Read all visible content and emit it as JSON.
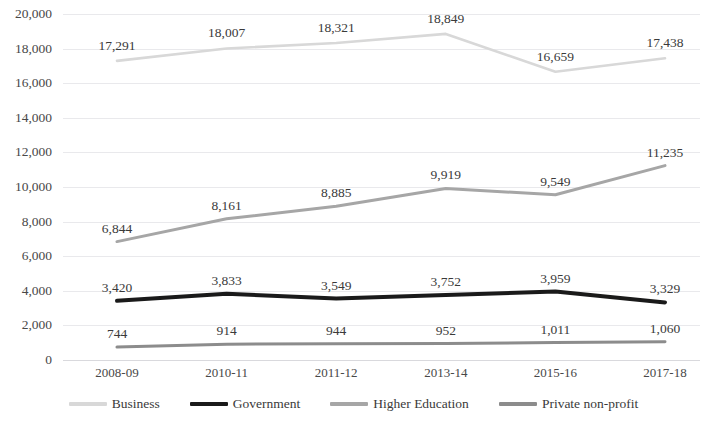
{
  "chart_data": {
    "type": "line",
    "title": "",
    "xlabel": "",
    "ylabel": "",
    "grid": true,
    "legend_position": "bottom",
    "ylim": [
      0,
      20000
    ],
    "ytick_step": 2000,
    "categories": [
      "2008-09",
      "2010-11",
      "2011-12",
      "2013-14",
      "2015-16",
      "2017-18"
    ],
    "yticks": [
      "0",
      "2,000",
      "4,000",
      "6,000",
      "8,000",
      "10,000",
      "12,000",
      "14,000",
      "16,000",
      "18,000",
      "20,000"
    ],
    "series": [
      {
        "name": "Business",
        "color": "#d8d8d8",
        "width": 2.6,
        "values": [
          17291,
          18007,
          18321,
          18849,
          16659,
          17438
        ],
        "labels": [
          "17,291",
          "18,007",
          "18,321",
          "18,849",
          "16,659",
          "17,438"
        ]
      },
      {
        "name": "Government",
        "color": "#1a1a1a",
        "width": 4.0,
        "values": [
          3420,
          3833,
          3549,
          3752,
          3959,
          3329
        ],
        "labels": [
          "3,420",
          "3,833",
          "3,549",
          "3,752",
          "3,959",
          "3,329"
        ]
      },
      {
        "name": "Higher Education",
        "color": "#a6a6a6",
        "width": 3.0,
        "values": [
          6844,
          8161,
          8885,
          9919,
          9549,
          11235
        ],
        "labels": [
          "6,844",
          "8,161",
          "8,885",
          "9,919",
          "9,549",
          "11,235"
        ]
      },
      {
        "name": "Private non-profit",
        "color": "#8c8c8c",
        "width": 3.0,
        "values": [
          744,
          914,
          944,
          952,
          1011,
          1060
        ],
        "labels": [
          "744",
          "914",
          "944",
          "952",
          "1,011",
          "1,060"
        ]
      }
    ]
  },
  "legend": {
    "items": [
      {
        "label": "Business",
        "color": "#d8d8d8"
      },
      {
        "label": "Government",
        "color": "#1a1a1a"
      },
      {
        "label": "Higher Education",
        "color": "#a6a6a6"
      },
      {
        "label": "Private non-profit",
        "color": "#8c8c8c"
      }
    ]
  },
  "colors": {
    "background": "#ffffff",
    "gridline": "#e9e9ec",
    "text": "#3f3f3f"
  }
}
